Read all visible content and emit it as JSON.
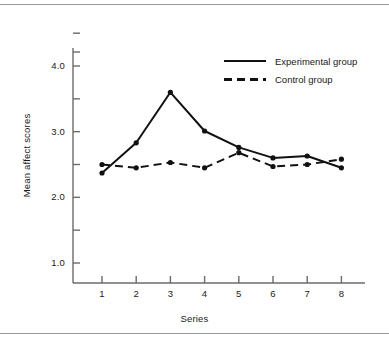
{
  "chart_data": {
    "type": "line",
    "title": "",
    "xlabel": "Series",
    "ylabel": "Mean affect scores",
    "categories": [
      "1",
      "2",
      "3",
      "4",
      "5",
      "6",
      "7",
      "8"
    ],
    "x": [
      1,
      2,
      3,
      4,
      5,
      6,
      7,
      8
    ],
    "series": [
      {
        "name": "Experimental group",
        "style": "solid",
        "color": "#111111",
        "marker": "circle",
        "values": [
          2.37,
          2.83,
          3.6,
          3.01,
          2.76,
          2.6,
          2.63,
          2.45
        ]
      },
      {
        "name": "Control group",
        "style": "dashed",
        "color": "#111111",
        "marker": "circle",
        "values": [
          2.5,
          2.45,
          2.53,
          2.45,
          2.68,
          2.47,
          2.5,
          2.58
        ]
      }
    ],
    "ylim": [
      0.65,
      4.72
    ],
    "xlim": [
      0.4,
      8.85
    ],
    "y_major_ticks": [
      1.0,
      2.0,
      3.0,
      4.0
    ],
    "y_minor_ticks": [
      1.5,
      2.5,
      3.5,
      4.5
    ],
    "y_tick_labels": [
      "1.0",
      "2.0",
      "3.0",
      "4.0"
    ],
    "grid": false,
    "legend_position": "upper right",
    "legend_entries": [
      "Experimental group",
      "Control group"
    ]
  },
  "figure": {
    "axis_color": "#6b6b6b",
    "line_color": "#111111",
    "background": "#ffffff",
    "rule_color": "#9a9a9a"
  }
}
